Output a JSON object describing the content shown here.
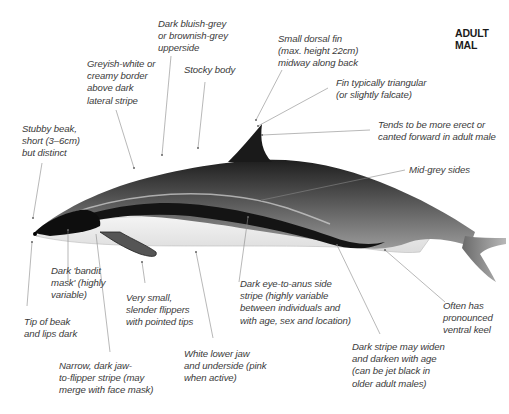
{
  "title": "ADULT MAL",
  "labels": {
    "upperside": [
      "Dark bluish-grey",
      "or brownish-grey",
      "upperside"
    ],
    "border": [
      "Greyish-white or",
      "creamy border",
      "above dark",
      "lateral stripe"
    ],
    "stocky": [
      "Stocky body"
    ],
    "dorsal": [
      "Small dorsal fin",
      "(max. height 22cm)",
      "midway along back"
    ],
    "fin_shape": [
      "Fin typically triangular",
      "(or slightly falcate)"
    ],
    "erect": [
      "Tends to be more erect or",
      "canted forward in adult male"
    ],
    "beak": [
      "Stubby beak,",
      "short (3–6cm)",
      "but distinct"
    ],
    "midgrey": [
      "Mid-grey sides"
    ],
    "mask": [
      "Dark 'bandit",
      "mask' (highly",
      "variable)"
    ],
    "flippers": [
      "Very small,",
      "slender flippers",
      "with pointed tips"
    ],
    "side_stripe": [
      "Dark eye-to-anus side",
      "stripe (highly variable",
      "between individuals and",
      "with age, sex and location)"
    ],
    "keel": [
      "Often has",
      "pronounced",
      "ventral keel"
    ],
    "tip": [
      "Tip of beak",
      "and lips dark"
    ],
    "underside": [
      "White lower jaw",
      "and underside (pink",
      "when active)"
    ],
    "stripe_age": [
      "Dark stripe may widen",
      "and darken with age",
      "(can be jet black in",
      "older adult males)"
    ],
    "jaw_stripe": [
      "Narrow, dark jaw-",
      "to-flipper stripe (may",
      "merge with face mask)"
    ]
  }
}
